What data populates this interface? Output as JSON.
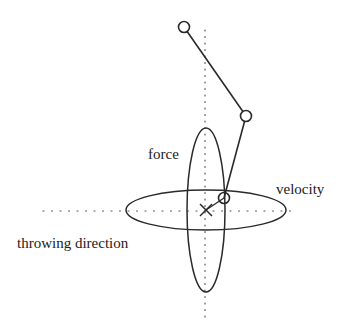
{
  "diagram": {
    "title": "",
    "colors": {
      "stroke": "#2a2a2a",
      "dots": "#555555",
      "text": "#222222",
      "background": "#ffffff"
    },
    "labels": {
      "force": "force",
      "velocity": "velocity",
      "throwing_direction": "throwing direction"
    },
    "elements": {
      "arm_joints": [
        {
          "name": "shoulder",
          "x": 184,
          "y": 27
        },
        {
          "name": "elbow",
          "x": 246,
          "y": 116
        },
        {
          "name": "hand",
          "x": 224,
          "y": 198
        }
      ],
      "target_marker": {
        "symbol": "×",
        "x": 206,
        "y": 210
      },
      "force_ellipse": {
        "cx": 206,
        "cy": 210,
        "rx": 19,
        "ry": 82,
        "label": "force"
      },
      "velocity_ellipse": {
        "cx": 206,
        "cy": 210,
        "rx": 80,
        "ry": 20,
        "label": "velocity"
      },
      "horizontal_axis": {
        "x1": 43,
        "x2": 295,
        "y": 211,
        "style": "dotted",
        "label": "throwing direction"
      },
      "vertical_axis": {
        "x": 205,
        "y1": 30,
        "y2": 318,
        "style": "dotted"
      }
    }
  }
}
